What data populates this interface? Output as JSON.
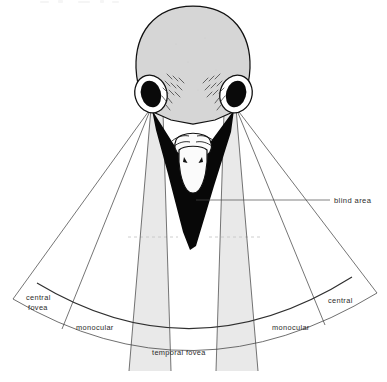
{
  "figure": {
    "background_color": "#ffffff"
  },
  "labels": {
    "blind_area": "blind area",
    "central_fovea_line1": "central",
    "central_fovea_line2": "fovea",
    "monocular_left": "monocular",
    "monocular_right": "monocular",
    "central_right": "central",
    "temporal_fovea": "temporal  fovea"
  },
  "colors": {
    "blind_area_fill": "#080808",
    "head_fill": "#d6d6d6",
    "binocular_cone_fill": "#e9e9e9",
    "beak_fill": "#fbfbfb",
    "eye_pupil": "#0a0a0a",
    "eye_ring": "#ffffff",
    "line_stroke": "#3a3a3a",
    "text_color": "#2b2b2b"
  },
  "regions": [
    {
      "name": "blind-area",
      "label": "blind area",
      "shading": "black"
    },
    {
      "name": "central-fovea-left",
      "label": "central fovea",
      "shading": "white"
    },
    {
      "name": "monocular-left",
      "label": "monocular",
      "shading": "white"
    },
    {
      "name": "temporal-fovea",
      "label": "temporal fovea",
      "shading": "white"
    },
    {
      "name": "monocular-right",
      "label": "monocular",
      "shading": "white"
    },
    {
      "name": "central-right",
      "label": "central",
      "shading": "white"
    },
    {
      "name": "binocular-cone-left",
      "label": "",
      "shading": "light-gray"
    },
    {
      "name": "binocular-cone-right",
      "label": "",
      "shading": "light-gray"
    }
  ]
}
